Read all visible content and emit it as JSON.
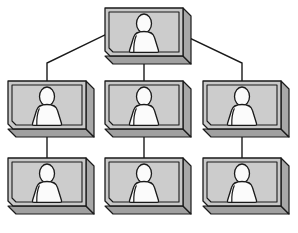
{
  "diagram": {
    "title": "Organization Hierarchy Chart",
    "type": "tree-diagram",
    "node_label": "person-card",
    "icon_name": "person-silhouette-icon",
    "background_color": "#ffffff",
    "canvas": {
      "width": 298,
      "height": 233
    },
    "style": {
      "card_face_color": "#c9c9c9",
      "card_side_color": "#a8a8a8",
      "card_bottom_color": "#a0a0a0",
      "card_inner_panel_color": "#cccccc",
      "card_border_color": "#1a1a1a",
      "figure_fill_color": "#fbfbfb",
      "figure_outline_color": "#1a1a1a",
      "connector_color": "#1a1a1a",
      "connector_width": 1.4,
      "card_depth": 8,
      "corner_cut": 5
    },
    "nodes": [
      {
        "id": "root",
        "name": "root-node",
        "row": 1,
        "col": 2,
        "x": 105,
        "y": 8,
        "w": 78,
        "h": 48
      },
      {
        "id": "n2a",
        "name": "left-mid-node",
        "row": 2,
        "col": 1,
        "x": 8,
        "y": 81,
        "w": 78,
        "h": 48
      },
      {
        "id": "n2b",
        "name": "center-mid-node",
        "row": 2,
        "col": 2,
        "x": 105,
        "y": 81,
        "w": 78,
        "h": 48
      },
      {
        "id": "n2c",
        "name": "right-mid-node",
        "row": 2,
        "col": 3,
        "x": 203,
        "y": 81,
        "w": 78,
        "h": 48
      },
      {
        "id": "n3a",
        "name": "left-leaf-node",
        "row": 3,
        "col": 1,
        "x": 8,
        "y": 158,
        "w": 78,
        "h": 48
      },
      {
        "id": "n3b",
        "name": "center-leaf-node",
        "row": 3,
        "col": 2,
        "x": 105,
        "y": 158,
        "w": 78,
        "h": 48
      },
      {
        "id": "n3c",
        "name": "right-leaf-node",
        "row": 3,
        "col": 3,
        "x": 203,
        "y": 158,
        "w": 78,
        "h": 48
      }
    ],
    "connectors": [
      {
        "name": "connector-root-to-left",
        "from": "root",
        "to": "n2a",
        "kind": "elbow-diagonal"
      },
      {
        "name": "connector-root-to-center",
        "from": "root",
        "to": "n2b",
        "kind": "straight-vertical"
      },
      {
        "name": "connector-root-to-right",
        "from": "root",
        "to": "n2c",
        "kind": "elbow-diagonal"
      },
      {
        "name": "connector-left-to-leaf",
        "from": "n2a",
        "to": "n3a",
        "kind": "straight-vertical"
      },
      {
        "name": "connector-center-to-leaf",
        "from": "n2b",
        "to": "n3b",
        "kind": "straight-vertical"
      },
      {
        "name": "connector-right-to-leaf",
        "from": "n2c",
        "to": "n3c",
        "kind": "straight-vertical"
      }
    ]
  }
}
